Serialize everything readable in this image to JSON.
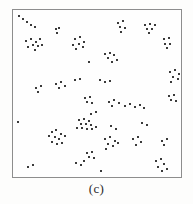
{
  "figure": {
    "caption": "(c)",
    "frame_color": "#8d8d8d",
    "point_color": "#3a3a3a",
    "background_color": "#fefefe"
  },
  "chart_data": {
    "type": "scatter",
    "title": "",
    "subtitle": "",
    "xlabel": "",
    "ylabel": "",
    "annotations": [
      "(c)"
    ],
    "grid": false,
    "legend_position": "none",
    "axis_ticks": [],
    "tick_labels": [],
    "xlim": [
      0,
      170
    ],
    "ylim": [
      0,
      169
    ],
    "note": "Unlabeled scatter of clustered points inside a plain rectangular frame; coordinates are in frame pixel space with origin at the frame top-left.",
    "point_count": 131,
    "points": [
      [
        5,
        5
      ],
      [
        9,
        8
      ],
      [
        13,
        11
      ],
      [
        17,
        14
      ],
      [
        21,
        16
      ],
      [
        12,
        30
      ],
      [
        17,
        28
      ],
      [
        22,
        31
      ],
      [
        26,
        28
      ],
      [
        19,
        34
      ],
      [
        24,
        35
      ],
      [
        28,
        34
      ],
      [
        14,
        36
      ],
      [
        21,
        39
      ],
      [
        42,
        18
      ],
      [
        46,
        17
      ],
      [
        44,
        22
      ],
      [
        62,
        28
      ],
      [
        67,
        26
      ],
      [
        71,
        31
      ],
      [
        66,
        33
      ],
      [
        60,
        34
      ],
      [
        70,
        36
      ],
      [
        63,
        38
      ],
      [
        105,
        12
      ],
      [
        110,
        10
      ],
      [
        107,
        16
      ],
      [
        112,
        17
      ],
      [
        108,
        21
      ],
      [
        133,
        14
      ],
      [
        138,
        13
      ],
      [
        143,
        14
      ],
      [
        135,
        18
      ],
      [
        140,
        18
      ],
      [
        137,
        22
      ],
      [
        152,
        28
      ],
      [
        157,
        27
      ],
      [
        153,
        33
      ],
      [
        158,
        33
      ],
      [
        155,
        37
      ],
      [
        92,
        44
      ],
      [
        97,
        42
      ],
      [
        101,
        45
      ],
      [
        95,
        48
      ],
      [
        104,
        50
      ],
      [
        99,
        52
      ],
      [
        76,
        52
      ],
      [
        158,
        62
      ],
      [
        163,
        60
      ],
      [
        167,
        64
      ],
      [
        161,
        67
      ],
      [
        166,
        69
      ],
      [
        159,
        72
      ],
      [
        22,
        78
      ],
      [
        27,
        76
      ],
      [
        24,
        82
      ],
      [
        43,
        74
      ],
      [
        48,
        72
      ],
      [
        52,
        76
      ],
      [
        46,
        78
      ],
      [
        62,
        70
      ],
      [
        67,
        69
      ],
      [
        87,
        70
      ],
      [
        92,
        72
      ],
      [
        97,
        71
      ],
      [
        157,
        86
      ],
      [
        162,
        85
      ],
      [
        159,
        90
      ],
      [
        164,
        91
      ],
      [
        72,
        88
      ],
      [
        77,
        87
      ],
      [
        74,
        92
      ],
      [
        79,
        93
      ],
      [
        96,
        92
      ],
      [
        101,
        90
      ],
      [
        106,
        93
      ],
      [
        99,
        96
      ],
      [
        112,
        96
      ],
      [
        117,
        94
      ],
      [
        122,
        97
      ],
      [
        127,
        95
      ],
      [
        132,
        98
      ],
      [
        78,
        104
      ],
      [
        83,
        102
      ],
      [
        66,
        110
      ],
      [
        71,
        109
      ],
      [
        76,
        111
      ],
      [
        68,
        114
      ],
      [
        73,
        114
      ],
      [
        78,
        115
      ],
      [
        64,
        118
      ],
      [
        69,
        118
      ],
      [
        74,
        119
      ],
      [
        79,
        119
      ],
      [
        83,
        117
      ],
      [
        98,
        116
      ],
      [
        103,
        119
      ],
      [
        4,
        112
      ],
      [
        38,
        122
      ],
      [
        43,
        120
      ],
      [
        48,
        124
      ],
      [
        35,
        127
      ],
      [
        41,
        128
      ],
      [
        46,
        130
      ],
      [
        52,
        127
      ],
      [
        38,
        133
      ],
      [
        44,
        135
      ],
      [
        49,
        134
      ],
      [
        130,
        113
      ],
      [
        135,
        115
      ],
      [
        92,
        130
      ],
      [
        97,
        128
      ],
      [
        102,
        132
      ],
      [
        95,
        135
      ],
      [
        100,
        137
      ],
      [
        105,
        134
      ],
      [
        93,
        140
      ],
      [
        120,
        130
      ],
      [
        125,
        128
      ],
      [
        129,
        133
      ],
      [
        123,
        136
      ],
      [
        150,
        132
      ],
      [
        155,
        130
      ],
      [
        152,
        136
      ],
      [
        74,
        144
      ],
      [
        79,
        143
      ],
      [
        76,
        148
      ],
      [
        81,
        149
      ],
      [
        14,
        158
      ],
      [
        19,
        156
      ],
      [
        63,
        154
      ],
      [
        68,
        156
      ],
      [
        71,
        152
      ],
      [
        88,
        162
      ],
      [
        144,
        152
      ],
      [
        149,
        150
      ],
      [
        152,
        155
      ],
      [
        146,
        158
      ],
      [
        155,
        160
      ],
      [
        150,
        162
      ]
    ]
  }
}
